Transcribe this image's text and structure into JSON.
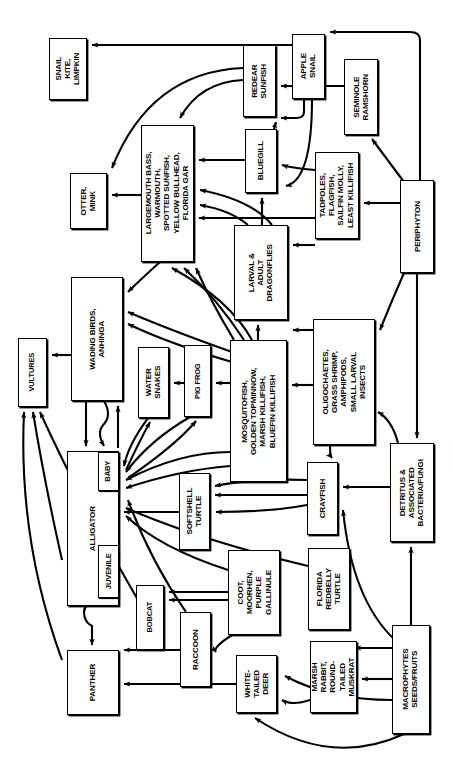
{
  "diagram": {
    "orientation": "rotated-90",
    "stroke_color": "#000000",
    "background_color": "#ffffff",
    "credit": "· · · · · · · · · ·"
  },
  "nodes": [
    {
      "id": "snail-kite-limpkin",
      "label": "SNAIL\nKITE,\nLIMPKIN",
      "x": 49,
      "y": 38,
      "w": 38,
      "h": 62
    },
    {
      "id": "redear-sunfish",
      "label": "REDEAR\nSUNFISH",
      "x": 243,
      "y": 45,
      "w": 33,
      "h": 72
    },
    {
      "id": "apple-snail",
      "label": "APPLE\nSNAIL",
      "x": 292,
      "y": 34,
      "w": 33,
      "h": 65
    },
    {
      "id": "seminole-ramshorn",
      "label": "SEMINOLE\nRAMSHORN",
      "x": 344,
      "y": 59,
      "w": 34,
      "h": 76
    },
    {
      "id": "largemouth-bass",
      "label": "LARGEMOUTH BASS,\nWARMOUTH,\nSPOTTED SUNFISH,\nYELLOW BULLHEAD,\nFLORIDA GAR",
      "x": 141,
      "y": 125,
      "w": 53,
      "h": 137
    },
    {
      "id": "bluegill",
      "label": "BLUEGILL",
      "x": 245,
      "y": 129,
      "w": 32,
      "h": 64
    },
    {
      "id": "otter-mink",
      "label": "OTTER,\nMINK",
      "x": 70,
      "y": 173,
      "w": 37,
      "h": 56
    },
    {
      "id": "tadpoles-flagfish",
      "label": "TADPOLES,\nFLAGFISH,\nSAILFIN MOLLY,\nLEAST KILLIFISH",
      "x": 315,
      "y": 152,
      "w": 44,
      "h": 87
    },
    {
      "id": "periphyton",
      "label": "PERIPHYTON",
      "x": 400,
      "y": 180,
      "w": 34,
      "h": 93
    },
    {
      "id": "larval-adult-dragonflies",
      "label": "LARVAL &\nADULT\nDRAGONFLIES",
      "x": 234,
      "y": 225,
      "w": 54,
      "h": 95
    },
    {
      "id": "wading-birds-anhinga",
      "label": "WADING BIRDS,\nANHINGA",
      "x": 71,
      "y": 277,
      "w": 52,
      "h": 124
    },
    {
      "id": "oligochaetes",
      "label": "OLIGOCHAETES,\nGRASS SHRIMP,\nAMPHIPODS,\nSMALL LARVAL\nINSECTS",
      "x": 313,
      "y": 319,
      "w": 62,
      "h": 126
    },
    {
      "id": "vultures",
      "label": "VULTURES",
      "x": 18,
      "y": 338,
      "w": 29,
      "h": 69
    },
    {
      "id": "water-snakes",
      "label": "WATER\nSNAKES",
      "x": 138,
      "y": 347,
      "w": 31,
      "h": 71
    },
    {
      "id": "pig-frog",
      "label": "PIG FROG",
      "x": 184,
      "y": 345,
      "w": 27,
      "h": 72
    },
    {
      "id": "mosquitofish",
      "label": "MOSQUITOFISH,\nGOLDEN TOPMINNOW,\nMARSH KILLIFISH,\nBLUEFIN KILLIFISH",
      "x": 230,
      "y": 340,
      "w": 57,
      "h": 142
    },
    {
      "id": "detritus",
      "label": "DETRITUS &\nASSOCIATED\nBACTERIA/FUNGI",
      "x": 390,
      "y": 443,
      "w": 44,
      "h": 99
    },
    {
      "id": "alligator",
      "label": "ALLIGATOR",
      "x": 67,
      "y": 451,
      "w": 52,
      "h": 155
    },
    {
      "id": "alligator-baby",
      "label": "BABY",
      "x": 98,
      "y": 452,
      "w": 21,
      "h": 39,
      "sub": true
    },
    {
      "id": "alligator-juvenile",
      "label": "JUVENILE",
      "x": 98,
      "y": 545,
      "w": 21,
      "h": 53,
      "sub": true
    },
    {
      "id": "softshell-turtle",
      "label": "SOFTSHELL\nTURTLE",
      "x": 179,
      "y": 473,
      "w": 31,
      "h": 77
    },
    {
      "id": "crayfish",
      "label": "CRAYFISH",
      "x": 307,
      "y": 462,
      "w": 31,
      "h": 73
    },
    {
      "id": "coot-moorhen",
      "label": "COOT,\nMOORHEN,\nPURPLE\nGALLINULE",
      "x": 228,
      "y": 550,
      "w": 52,
      "h": 85
    },
    {
      "id": "florida-redbelly-turtle",
      "label": "FLORIDA\nREDBELLY\nTURTLE",
      "x": 308,
      "y": 548,
      "w": 42,
      "h": 82
    },
    {
      "id": "macrophytes",
      "label": "MACROPHYTES\nSEEDS/FRUITS",
      "x": 392,
      "y": 625,
      "w": 38,
      "h": 109
    },
    {
      "id": "bobcat",
      "label": "BOBCAT",
      "x": 136,
      "y": 585,
      "w": 28,
      "h": 65
    },
    {
      "id": "raccoon",
      "label": "RACCOON",
      "x": 180,
      "y": 612,
      "w": 31,
      "h": 75
    },
    {
      "id": "white-tailed-deer",
      "label": "WHITE-\nTAILED\nDEER",
      "x": 236,
      "y": 655,
      "w": 41,
      "h": 58
    },
    {
      "id": "marsh-rabbit",
      "label": "MARSH\nRABBIT,\nROUND-\nTAILED\nMUSKRAT",
      "x": 310,
      "y": 641,
      "w": 47,
      "h": 72
    },
    {
      "id": "panther",
      "label": "PANTHER",
      "x": 67,
      "y": 650,
      "w": 52,
      "h": 65
    }
  ]
}
